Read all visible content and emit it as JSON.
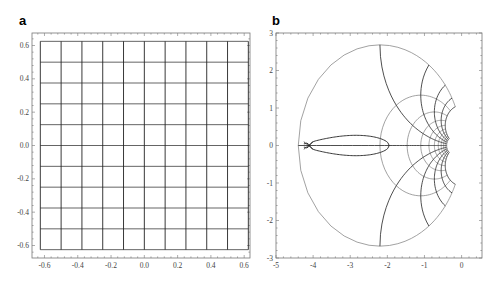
{
  "chart_data": [
    {
      "panel": "a",
      "type": "line",
      "title": "",
      "description": "Uniform square grid in the z-plane",
      "xlabel": "",
      "ylabel": "",
      "xlim": [
        -0.675,
        0.635
      ],
      "ylim": [
        -0.675,
        0.675
      ],
      "xticks": [
        -0.6,
        -0.4,
        -0.2,
        0.0,
        0.2,
        0.4,
        0.6
      ],
      "yticks": [
        -0.6,
        -0.4,
        -0.2,
        0.0,
        0.2,
        0.4,
        0.6
      ],
      "xtick_labels": [
        "-0.6",
        "-0.4",
        "-0.2",
        "0.0",
        "0.2",
        "0.4",
        "0.6"
      ],
      "ytick_labels": [
        "-0.6",
        "-0.4",
        "-0.2",
        "0.0",
        "0.2",
        "0.4",
        "0.6"
      ],
      "grid_lines": {
        "x": [
          -0.625,
          -0.5,
          -0.375,
          -0.25,
          -0.125,
          0.0,
          0.125,
          0.25,
          0.375,
          0.5,
          0.625
        ],
        "y": [
          -0.625,
          -0.5,
          -0.375,
          -0.25,
          -0.125,
          0.0,
          0.125,
          0.25,
          0.375,
          0.5,
          0.625
        ]
      },
      "grid": false,
      "legend": null
    },
    {
      "panel": "b",
      "type": "line",
      "title": "",
      "description": "Conformal image of the square grid: family of nested circular arcs (gray) converging at the origin, orthogonal dark curves, with a Joukowski-type airfoil contour near the left",
      "xlabel": "",
      "ylabel": "",
      "xlim": [
        -5,
        0.55
      ],
      "ylim": [
        -3,
        3
      ],
      "xticks": [
        -5,
        -4,
        -3,
        -2,
        -1,
        0
      ],
      "yticks": [
        -3,
        -2,
        -1,
        0,
        1,
        2,
        3
      ],
      "xtick_labels": [
        "-5",
        "-4",
        "-3",
        "-2",
        "-1",
        "0"
      ],
      "ytick_labels": [
        "-3",
        "-2",
        "-1",
        "0",
        "1",
        "2",
        "3"
      ],
      "map": {
        "A": 0.55,
        "B": 0.75,
        "y_stretch": 1.22
      },
      "airfoil": {
        "tail": [
          -4.25,
          0.0
        ],
        "nose": [
          -1.95,
          0.0
        ],
        "max_thickness": 0.38
      },
      "grid": false,
      "legend": null
    }
  ],
  "labels": {
    "panel_a": "a",
    "panel_b": "b"
  },
  "colors": {
    "grid_dark": "#222222",
    "grid_gray": "#8a8a8a",
    "frame": "#777777",
    "tick_text": "#444444"
  }
}
